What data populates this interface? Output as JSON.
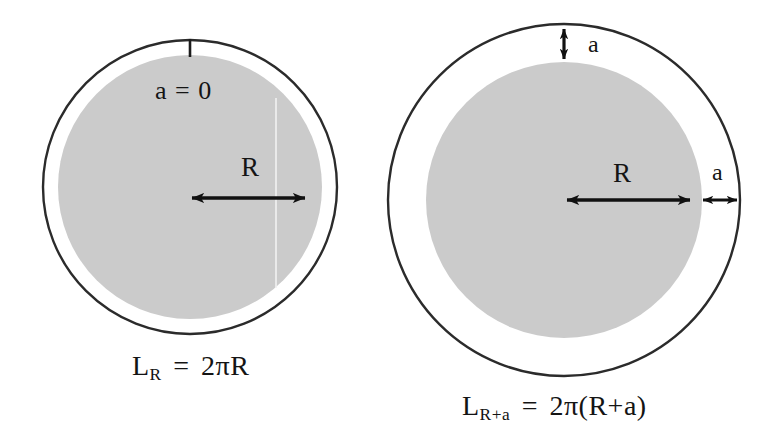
{
  "figure": {
    "domain": "diagram",
    "background_color": "#ffffff",
    "colors": {
      "stroke": "#2b2b2b",
      "fill_gray": "#cbcbcb",
      "text": "#141414",
      "arrow": "#111111"
    }
  },
  "panels": [
    {
      "id": "left",
      "name": "circle-radius-R",
      "outer_circle": {
        "cx": 190,
        "cy": 187,
        "r": 147
      },
      "inner_circle": {
        "cx": 190,
        "cy": 187,
        "r": 132
      },
      "gap_label": "a = 0",
      "radius_label": "R",
      "formula": {
        "base": "L",
        "subscript": "R",
        "equals": "=",
        "rhs": "2πR",
        "full": "L_R = 2πR"
      },
      "tick": {
        "x": 190,
        "y1": 40,
        "y2": 57
      },
      "radius_arrow": {
        "x1": 190,
        "y1": 198,
        "x2": 307,
        "y2": 198
      }
    },
    {
      "id": "right",
      "name": "circle-radius-R-plus-a",
      "outer_circle": {
        "cx": 564,
        "cy": 200,
        "r": 176
      },
      "inner_circle": {
        "cx": 564,
        "cy": 200,
        "r": 138
      },
      "gap_label_top": "a",
      "gap_label_right": "a",
      "radius_label": "R",
      "formula": {
        "base": "L",
        "subscript": "R+a",
        "equals": "=",
        "rhs": "2π(R+a)",
        "full": "L_{R+a} = 2π(R+a)"
      },
      "radius_arrow": {
        "x1": 565,
        "y1": 200,
        "x2": 692,
        "y2": 200
      },
      "gap_arrow_top": {
        "x": 564,
        "y1": 27,
        "y2": 61
      },
      "gap_arrow_right": {
        "x1": 700,
        "x2": 740,
        "y": 200
      }
    }
  ]
}
